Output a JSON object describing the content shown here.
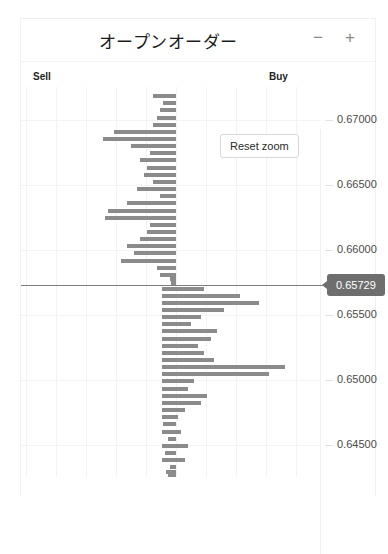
{
  "statusbar": {
    "text": ""
  },
  "card": {
    "title": "オープンオーダー",
    "controls": {
      "minus_label": "−",
      "plus_label": "+"
    }
  },
  "sides": {
    "sell_label": "Sell",
    "buy_label": "Buy"
  },
  "reset_zoom_label": "Reset zoom",
  "price_marker": {
    "value": "0.65729"
  },
  "colors": {
    "bar": "#8b8b8b",
    "badge_bg": "#6e6e6e",
    "badge_text": "#ffffff",
    "grid": "#f3f3f3",
    "price_line": "#7d7d7d"
  },
  "chart_data": {
    "type": "bar",
    "orientation": "horizontal",
    "title": "オープンオーダー",
    "xlabel": "",
    "ylabel": "",
    "grid": true,
    "legend": "none",
    "ylim": [
      0.6425,
      0.6725
    ],
    "y_ticks": [
      "0.67000",
      "0.66500",
      "0.66000",
      "0.65500",
      "0.65000",
      "0.64500"
    ],
    "y_tick_values": [
      0.67,
      0.665,
      0.66,
      0.655,
      0.65,
      0.645
    ],
    "x_ticks": [
      "",
      "",
      "",
      "",
      "",
      "",
      "",
      "",
      ""
    ],
    "current_price": 0.65729,
    "series": [
      {
        "name": "Sell",
        "side": "sell",
        "note": "bars extending left from center axis",
        "points": [
          {
            "price": 0.6718,
            "size": 14
          },
          {
            "price": 0.67125,
            "size": 8
          },
          {
            "price": 0.6707,
            "size": 10
          },
          {
            "price": 0.67015,
            "size": 12
          },
          {
            "price": 0.6696,
            "size": 14
          },
          {
            "price": 0.66905,
            "size": 38
          },
          {
            "price": 0.6685,
            "size": 45
          },
          {
            "price": 0.66795,
            "size": 28
          },
          {
            "price": 0.6674,
            "size": 16
          },
          {
            "price": 0.66685,
            "size": 22
          },
          {
            "price": 0.6663,
            "size": 18
          },
          {
            "price": 0.66575,
            "size": 20
          },
          {
            "price": 0.6652,
            "size": 14
          },
          {
            "price": 0.66465,
            "size": 24
          },
          {
            "price": 0.6641,
            "size": 10
          },
          {
            "price": 0.66355,
            "size": 30
          },
          {
            "price": 0.663,
            "size": 42
          },
          {
            "price": 0.66245,
            "size": 44
          },
          {
            "price": 0.6619,
            "size": 16
          },
          {
            "price": 0.66135,
            "size": 18
          },
          {
            "price": 0.6608,
            "size": 22
          },
          {
            "price": 0.66025,
            "size": 30
          },
          {
            "price": 0.6597,
            "size": 26
          },
          {
            "price": 0.65915,
            "size": 34
          },
          {
            "price": 0.6586,
            "size": 12
          },
          {
            "price": 0.65805,
            "size": 10
          },
          {
            "price": 0.6577,
            "size": 4
          },
          {
            "price": 0.65745,
            "size": 3
          }
        ]
      },
      {
        "name": "Buy",
        "side": "buy",
        "note": "bars extending right from center axis",
        "points": [
          {
            "price": 0.657,
            "size": 26
          },
          {
            "price": 0.65645,
            "size": 48
          },
          {
            "price": 0.6559,
            "size": 60
          },
          {
            "price": 0.65535,
            "size": 38
          },
          {
            "price": 0.6548,
            "size": 24
          },
          {
            "price": 0.65425,
            "size": 18
          },
          {
            "price": 0.6537,
            "size": 34
          },
          {
            "price": 0.65315,
            "size": 30
          },
          {
            "price": 0.6526,
            "size": 22
          },
          {
            "price": 0.65205,
            "size": 26
          },
          {
            "price": 0.6515,
            "size": 32
          },
          {
            "price": 0.65095,
            "size": 76
          },
          {
            "price": 0.6504,
            "size": 66
          },
          {
            "price": 0.64985,
            "size": 20
          },
          {
            "price": 0.6493,
            "size": 16
          },
          {
            "price": 0.64875,
            "size": 28
          },
          {
            "price": 0.6482,
            "size": 24
          },
          {
            "price": 0.64765,
            "size": 14
          },
          {
            "price": 0.6471,
            "size": 10
          },
          {
            "price": 0.64655,
            "size": 8
          },
          {
            "price": 0.646,
            "size": 12
          },
          {
            "price": 0.64545,
            "size": 5
          },
          {
            "price": 0.6449,
            "size": 16
          },
          {
            "price": 0.64435,
            "size": 7
          },
          {
            "price": 0.6438,
            "size": 14
          },
          {
            "price": 0.64325,
            "size": 4
          },
          {
            "price": 0.6429,
            "size": 6
          },
          {
            "price": 0.64255,
            "size": 5
          },
          {
            "price": 0.6422,
            "size": 12
          }
        ]
      }
    ]
  }
}
